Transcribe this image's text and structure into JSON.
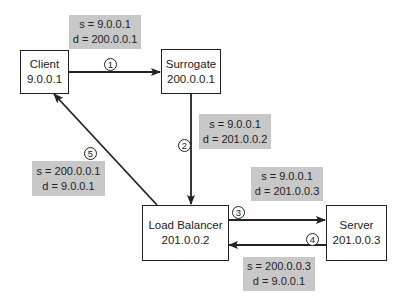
{
  "nodes": {
    "client": {
      "name": "Client",
      "ip": "9.0.0.1"
    },
    "surrogate": {
      "name": "Surrogate",
      "ip": "200.0.0.1"
    },
    "load_balancer": {
      "name": "Load Balancer",
      "ip": "201.0.0.2"
    },
    "server": {
      "name": "Server",
      "ip": "201.0.0.3"
    }
  },
  "steps": [
    {
      "number": "1",
      "from": "Client",
      "to": "Surrogate",
      "s": "s = 9.0.0.1",
      "d": "d = 200.0.0.1"
    },
    {
      "number": "2",
      "from": "Surrogate",
      "to": "Load Balancer",
      "s": "s = 9.0.0.1",
      "d": "d = 201.0.0.2"
    },
    {
      "number": "3",
      "from": "Load Balancer",
      "to": "Server",
      "s": "s = 9.0.0.1",
      "d": "d = 201.0.0.3"
    },
    {
      "number": "4",
      "from": "Server",
      "to": "Load Balancer",
      "s": "s = 200.0.0.3",
      "d": "d = 9.0.0.1"
    },
    {
      "number": "5",
      "from": "Load Balancer",
      "to": "Client",
      "s": "s = 200.0.0.1",
      "d": "d = 9.0.0.1"
    }
  ],
  "colors": {
    "label_bg": "#c8c8c8",
    "line": "#222222"
  }
}
